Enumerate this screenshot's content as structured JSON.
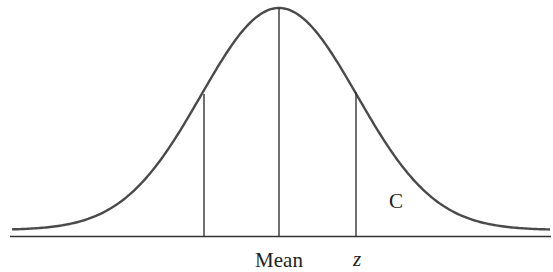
{
  "diagram": {
    "type": "normal-distribution-curve",
    "labels": {
      "mean": "Mean",
      "z": "z",
      "region": "C"
    },
    "colors": {
      "curve": "#4a4a4a",
      "lines": "#333333",
      "background": "#ffffff"
    }
  },
  "chart_data": {
    "type": "line",
    "title": "",
    "xlabel": "",
    "ylabel": "",
    "x_markers": [
      {
        "position": "-z",
        "label": ""
      },
      {
        "position": "mean",
        "label": "Mean"
      },
      {
        "position": "z",
        "label": "z"
      }
    ],
    "region_labels": [
      {
        "label": "C",
        "region": "right tail beyond z"
      }
    ],
    "grid": false,
    "legend": false
  }
}
